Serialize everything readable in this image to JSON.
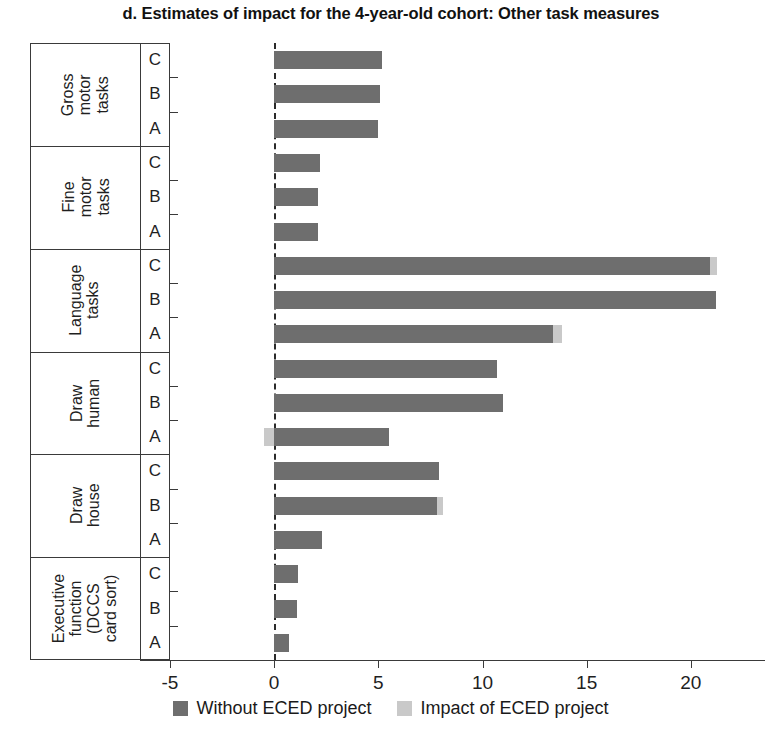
{
  "chart_data": {
    "type": "bar",
    "orientation": "horizontal",
    "stacked": true,
    "title": "d. Estimates of  impact for the 4-year-old cohort: Other task measures",
    "xlabel": "",
    "ylabel": "",
    "xlim": [
      -5,
      25
    ],
    "xticks": [
      -5,
      0,
      5,
      10,
      15,
      20,
      25
    ],
    "xtick_labels": [
      "-5",
      "0",
      "5",
      "10",
      "15",
      "20",
      "25"
    ],
    "grid": false,
    "zero_reference_line": true,
    "legend_position": "bottom",
    "colors": {
      "without_project": "#6e6e6e",
      "impact": "#c9c9c9",
      "axis": "#3a3a3a",
      "text": "#1a1a1a"
    },
    "series": [
      {
        "name": "Without ECED project",
        "color": "#6e6e6e"
      },
      {
        "name": "Impact of ECED project",
        "color": "#c9c9c9"
      }
    ],
    "subcategories": [
      "C",
      "B",
      "A"
    ],
    "groups": [
      {
        "label_lines": [
          "Gross",
          "motor",
          "tasks"
        ],
        "rows": [
          {
            "sub": "C",
            "without_project": 5.2,
            "impact": 0.0
          },
          {
            "sub": "B",
            "without_project": 5.1,
            "impact": 0.0
          },
          {
            "sub": "A",
            "without_project": 5.0,
            "impact": 0.0
          }
        ]
      },
      {
        "label_lines": [
          "Fine",
          "motor",
          "tasks"
        ],
        "rows": [
          {
            "sub": "C",
            "without_project": 2.2,
            "impact": 0.0
          },
          {
            "sub": "B",
            "without_project": 2.1,
            "impact": 0.0
          },
          {
            "sub": "A",
            "without_project": 2.1,
            "impact": 0.0
          }
        ]
      },
      {
        "label_lines": [
          "Language",
          "tasks"
        ],
        "rows": [
          {
            "sub": "C",
            "without_project": 20.9,
            "impact": 0.35
          },
          {
            "sub": "B",
            "without_project": 21.2,
            "impact": 0.0
          },
          {
            "sub": "A",
            "without_project": 13.4,
            "impact": 0.4
          }
        ]
      },
      {
        "label_lines": [
          "Draw",
          "human"
        ],
        "rows": [
          {
            "sub": "C",
            "without_project": 10.7,
            "impact": 0.0
          },
          {
            "sub": "B",
            "without_project": 11.0,
            "impact": 0.0
          },
          {
            "sub": "A",
            "without_project": 5.5,
            "impact": -0.5
          }
        ]
      },
      {
        "label_lines": [
          "Draw",
          "house"
        ],
        "rows": [
          {
            "sub": "C",
            "without_project": 7.9,
            "impact": 0.0
          },
          {
            "sub": "B",
            "without_project": 7.8,
            "impact": 0.3
          },
          {
            "sub": "A",
            "without_project": 2.3,
            "impact": 0.0
          }
        ]
      },
      {
        "label_lines": [
          "Executive",
          "function",
          "(DCCS",
          "card sort)"
        ],
        "rows": [
          {
            "sub": "C",
            "without_project": 1.15,
            "impact": 0.0
          },
          {
            "sub": "B",
            "without_project": 1.1,
            "impact": 0.0
          },
          {
            "sub": "A",
            "without_project": 0.7,
            "impact": 0.0
          }
        ]
      }
    ]
  }
}
